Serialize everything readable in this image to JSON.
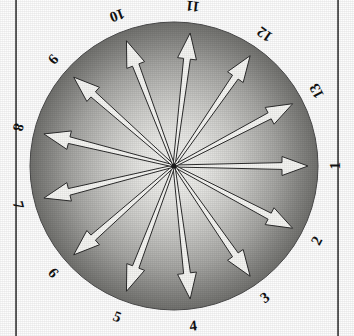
{
  "chart_data": {
    "type": "scatter",
    "title": "",
    "xlabel": "",
    "ylabel": "",
    "layout": {
      "center_x": 174,
      "center_y": 166,
      "radius": 144,
      "arrow_count": 13,
      "angle_step_deg": 27.69,
      "first_label_angle_deg": 0,
      "direction": "counterclockwise",
      "grid": false,
      "legend": false
    },
    "categories": [
      "1",
      "2",
      "3",
      "4",
      "5",
      "6",
      "7",
      "8",
      "9",
      "10",
      "11",
      "12",
      "13"
    ],
    "values": [
      1,
      2,
      3,
      4,
      5,
      6,
      7,
      8,
      9,
      10,
      11,
      12,
      13
    ],
    "series": [
      {
        "name": "arrows",
        "angles_deg": [
          0,
          332.31,
          304.62,
          276.92,
          249.23,
          221.54,
          193.85,
          166.15,
          138.46,
          110.77,
          83.08,
          55.38,
          27.69
        ],
        "lengths": [
          1,
          1,
          1,
          1,
          1,
          1,
          1,
          1,
          1,
          1,
          1,
          1,
          1
        ]
      }
    ]
  },
  "colors": {
    "arrow_fill": "#f5f5f2",
    "arrow_stroke": "#2b2b2b",
    "disc_center": "#f3f3f1",
    "disc_edge": "#6b6b6b",
    "label_text": "#111111",
    "frame_line": "#3a3a3a",
    "background": "#fdfdfd"
  },
  "labels": [
    {
      "text": "1",
      "angle_deg": 0,
      "rotation_deg": -90
    },
    {
      "text": "2",
      "angle_deg": 332.31,
      "rotation_deg": -62.31
    },
    {
      "text": "3",
      "angle_deg": 304.62,
      "rotation_deg": -34.62
    },
    {
      "text": "4",
      "angle_deg": 276.92,
      "rotation_deg": -6.92
    },
    {
      "text": "5",
      "angle_deg": 249.23,
      "rotation_deg": 20.77
    },
    {
      "text": "6",
      "angle_deg": 221.54,
      "rotation_deg": 48.46
    },
    {
      "text": "7",
      "angle_deg": 193.85,
      "rotation_deg": 76.15
    },
    {
      "text": "8",
      "angle_deg": 166.15,
      "rotation_deg": 103.85
    },
    {
      "text": "9",
      "angle_deg": 138.46,
      "rotation_deg": 131.54
    },
    {
      "text": "10",
      "angle_deg": 110.77,
      "rotation_deg": 159.23
    },
    {
      "text": "11",
      "angle_deg": 83.08,
      "rotation_deg": 186.92
    },
    {
      "text": "12",
      "angle_deg": 55.38,
      "rotation_deg": 214.62
    },
    {
      "text": "13",
      "angle_deg": 27.69,
      "rotation_deg": 242.31
    }
  ]
}
